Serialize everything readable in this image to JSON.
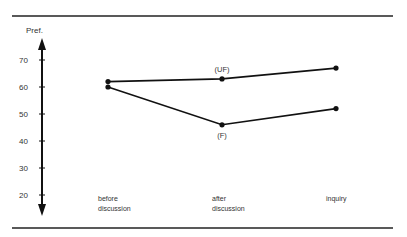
{
  "chart_data": {
    "type": "line",
    "title": "",
    "ylabel": "Pref.",
    "xlabel": "",
    "categories": [
      "before discussion",
      "after discussion",
      "inquiry"
    ],
    "category_lines": [
      [
        "before",
        "discussion"
      ],
      [
        "after",
        "discussion"
      ],
      [
        "inquiry"
      ]
    ],
    "yticks": [
      20,
      30,
      40,
      50,
      60,
      70
    ],
    "ylim": [
      15,
      78
    ],
    "grid": false,
    "series": [
      {
        "name": "(UF)",
        "values": [
          62,
          63,
          67
        ]
      },
      {
        "name": "(F)",
        "values": [
          60,
          46,
          52
        ]
      }
    ]
  }
}
